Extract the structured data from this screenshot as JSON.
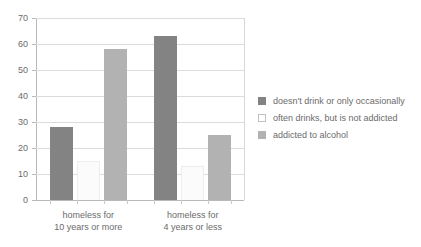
{
  "chart_data": {
    "type": "bar",
    "title": "",
    "xlabel": "",
    "ylabel": "",
    "ylim": [
      0,
      70
    ],
    "ytick_step": 10,
    "yticks": [
      "70",
      "60",
      "50",
      "40",
      "30",
      "20",
      "10",
      "0"
    ],
    "grid": true,
    "legend_position": "right",
    "categories": [
      {
        "line1": "homeless for",
        "line2": "10 years or more"
      },
      {
        "line1": "homeless for",
        "line2": "4 years or less"
      }
    ],
    "series": [
      {
        "name": "doesn't drink or only occasionally",
        "color": "#838383",
        "swatch": "dark",
        "values": [
          28,
          63
        ]
      },
      {
        "name": "often drinks, but is not addicted",
        "color": "#ffffff",
        "swatch": "white",
        "values": [
          15,
          13
        ]
      },
      {
        "name": "addicted to alcohol",
        "color": "#b2b2b2",
        "swatch": "light",
        "values": [
          58,
          25
        ]
      }
    ]
  }
}
